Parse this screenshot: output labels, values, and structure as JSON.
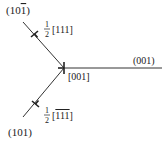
{
  "diagram": {
    "type": "dislocation-junction",
    "colors": {
      "line": "#333333",
      "text": "#222222",
      "background": "#ffffff"
    },
    "arms": [
      {
        "plane_label": "(10",
        "plane_label_bar": "1",
        "plane_label_close": ")",
        "burgers_frac_num": "1",
        "burgers_frac_den": "2",
        "burgers_vector": "[111]"
      },
      {
        "plane_label": "(101)",
        "burgers_frac_num": "1",
        "burgers_frac_den": "2",
        "burgers_vector_open": "[",
        "burgers_vector_bar": "111",
        "burgers_vector_close": "]"
      },
      {
        "plane_label": "(001)",
        "burgers_vector": "[001]"
      }
    ]
  }
}
